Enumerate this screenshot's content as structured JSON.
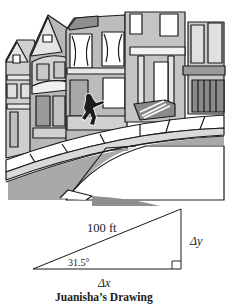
{
  "illustration": {
    "description": "Cartoon of a person walking up a steep sidewalk in front of row houses",
    "figure": "walking-person"
  },
  "diagram": {
    "hypotenuse_label": "100 ft",
    "angle_label": "31.5°",
    "vertical_label": "Δy",
    "horizontal_label": "Δx",
    "right_angle_marker": true,
    "caption": "Juanisha’s Drawing"
  },
  "colors": {
    "line": "#1a1a1a",
    "street": "#a9a9a9",
    "building_dark": "#8c8c8c",
    "building_mid": "#b5b5b5",
    "building_light": "#d6d6d6",
    "sidewalk": "#ffffff"
  }
}
